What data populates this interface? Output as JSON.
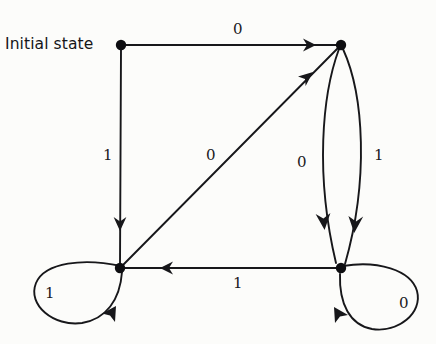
{
  "diagram": {
    "kind": "finite-state-machine",
    "caption": "Initial state",
    "background_color": "#fcfcfa",
    "stroke_color": "#17171a",
    "node_color": "#0e0e11",
    "states": [
      {
        "id": "s0",
        "role": "initial",
        "x": 121,
        "y": 45
      },
      {
        "id": "s1",
        "role": "normal",
        "x": 341,
        "y": 45
      },
      {
        "id": "s2",
        "role": "normal",
        "x": 120,
        "y": 268
      },
      {
        "id": "s3",
        "role": "normal",
        "x": 341,
        "y": 268
      }
    ],
    "transitions": [
      {
        "name": "top-edge",
        "from": "s0",
        "to": "s1",
        "input": "0",
        "shape": "straight-horizontal",
        "label_x": 233,
        "label_y": 22
      },
      {
        "name": "left-edge",
        "from": "s0",
        "to": "s2",
        "input": "1",
        "shape": "straight-vertical",
        "label_x": 103,
        "label_y": 148
      },
      {
        "name": "diagonal-edge",
        "from": "s2",
        "to": "s1",
        "input": "0",
        "shape": "straight-diagonal",
        "label_x": 206,
        "label_y": 148
      },
      {
        "name": "right-inner-curve",
        "from": "s1",
        "to": "s3",
        "input": "0",
        "shape": "curve-left-bow",
        "label_x": 297,
        "label_y": 155
      },
      {
        "name": "right-outer-curve",
        "from": "s1",
        "to": "s3",
        "input": "1",
        "shape": "curve-right-bow",
        "label_x": 374,
        "label_y": 148
      },
      {
        "name": "bottom-edge",
        "from": "s3",
        "to": "s2",
        "input": "1",
        "shape": "straight-horizontal",
        "label_x": 233,
        "label_y": 276
      },
      {
        "name": "left-self-loop",
        "from": "s2",
        "to": "s2",
        "input": "1",
        "shape": "self-loop-left",
        "label_x": 45,
        "label_y": 286
      },
      {
        "name": "right-self-loop",
        "from": "s3",
        "to": "s3",
        "input": "0",
        "shape": "self-loop-right",
        "label_x": 399,
        "label_y": 296
      }
    ],
    "caption_position": {
      "x": 5,
      "y": 37
    }
  }
}
